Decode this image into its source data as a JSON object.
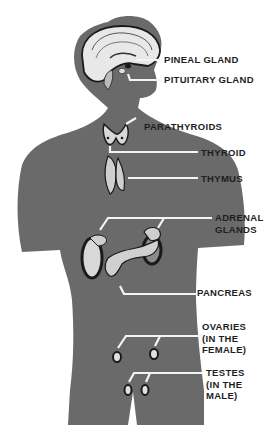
{
  "diagram": {
    "colors": {
      "background": "#ffffff",
      "silhouette": "#6a6a6a",
      "leader_lines": "#f4f4f4",
      "organ_light": "#d8d8d8",
      "organ_dark": "#1a1a1a",
      "text": "#1e1e1e"
    },
    "labels": [
      {
        "id": "pineal",
        "lines": [
          "PINEAL GLAND"
        ]
      },
      {
        "id": "pituitary",
        "lines": [
          "PITUITARY GLAND"
        ]
      },
      {
        "id": "parathyroids",
        "lines": [
          "PARATHYROIDS"
        ]
      },
      {
        "id": "thyroid",
        "lines": [
          "THYROID"
        ]
      },
      {
        "id": "thymus",
        "lines": [
          "THYMUS"
        ]
      },
      {
        "id": "adrenal",
        "lines": [
          "ADRENAL",
          "GLANDS"
        ]
      },
      {
        "id": "pancreas",
        "lines": [
          "PANCREAS"
        ]
      },
      {
        "id": "ovaries",
        "lines": [
          "OVARIES",
          "(IN THE",
          "FEMALE)"
        ]
      },
      {
        "id": "testes",
        "lines": [
          "TESTES",
          "(IN THE",
          "MALE)"
        ]
      }
    ]
  }
}
